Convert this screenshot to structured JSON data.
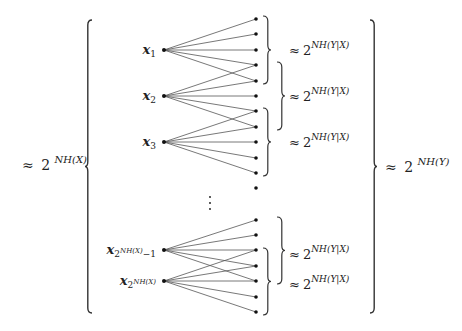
{
  "diagram": {
    "type": "bipartite-typical-set",
    "colors": {
      "line": "#555555",
      "dot": "#111111",
      "text": "#222222",
      "brace": "#333333"
    },
    "left_total_label": {
      "approx": "≈",
      "base": "2",
      "exp": "NH(X)"
    },
    "right_total_label": {
      "approx": "≈",
      "base": "2",
      "exp": "NH(Y)"
    },
    "inputs": [
      {
        "name": "x",
        "sub": "1",
        "subsup": "",
        "subtail": "",
        "y": 50,
        "targets": [
          0,
          1,
          2,
          3,
          4
        ]
      },
      {
        "name": "x",
        "sub": "2",
        "subsup": "",
        "subtail": "",
        "y": 96,
        "targets": [
          3,
          4,
          5,
          6,
          7
        ]
      },
      {
        "name": "x",
        "sub": "3",
        "subsup": "",
        "subtail": "",
        "y": 142,
        "targets": [
          6,
          7,
          8,
          9,
          10
        ]
      },
      {
        "name": "x",
        "sub": "2",
        "subsup": "NH(X)",
        "subtail": "−1",
        "y": 250,
        "targets": [
          12,
          13,
          14,
          15,
          16
        ]
      },
      {
        "name": "x",
        "sub": "2",
        "subsup": "NH(X)",
        "subtail": "",
        "y": 281,
        "targets": [
          14,
          15,
          16,
          17,
          18
        ]
      }
    ],
    "input_x": 164,
    "output_x": 256,
    "outputs_y": [
      19,
      34,
      50,
      65,
      81,
      96,
      111,
      127,
      142,
      158,
      173,
      188,
      220,
      235,
      250,
      266,
      281,
      297,
      312
    ],
    "ellipsis": {
      "x": 210,
      "ys": [
        197,
        203,
        209
      ],
      "glyph": "⋮"
    },
    "fan_labels": [
      {
        "approx": "≈",
        "base": "2",
        "exp": "NH(Y|X)",
        "y": 50
      },
      {
        "approx": "≈",
        "base": "2",
        "exp": "NH(Y|X)",
        "y": 96
      },
      {
        "approx": "≈",
        "base": "2",
        "exp": "NH(Y|X)",
        "y": 142
      },
      {
        "approx": "≈",
        "base": "2",
        "exp": "NH(Y|X)",
        "y": 254
      },
      {
        "approx": "≈",
        "base": "2",
        "exp": "NH(Y|X)",
        "y": 284
      }
    ],
    "small_braces": [
      {
        "x": 263,
        "y1": 16,
        "y2": 84
      },
      {
        "x": 277,
        "y1": 62,
        "y2": 130
      },
      {
        "x": 263,
        "y1": 108,
        "y2": 176
      },
      {
        "x": 277,
        "y1": 217,
        "y2": 284
      },
      {
        "x": 263,
        "y1": 248,
        "y2": 315
      }
    ],
    "big_left_brace": {
      "x": 92,
      "y1": 20,
      "y2": 313
    },
    "big_right_brace": {
      "x": 370,
      "y1": 20,
      "y2": 313
    }
  }
}
